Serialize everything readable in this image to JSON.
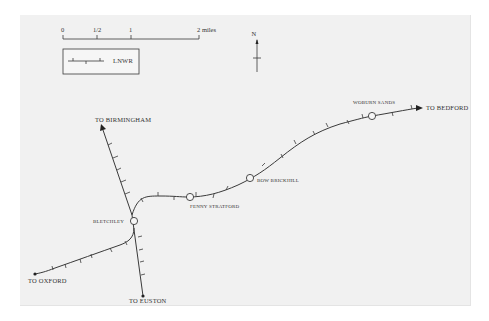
{
  "map": {
    "title": "Railway map around Bletchley",
    "scale_bar": {
      "ticks": [
        "0",
        "1/2",
        "1",
        "2 miles"
      ],
      "unit": "miles"
    },
    "legend": {
      "items": [
        {
          "symbol": "railway-line-with-ticks",
          "label": "LNWR"
        }
      ]
    },
    "north_arrow": {
      "label": "N"
    },
    "stations": [
      {
        "name": "BLETCHLEY"
      },
      {
        "name": "FENNY STRATFORD"
      },
      {
        "name": "BOW BRICKHILL"
      },
      {
        "name": "WOBURN SANDS"
      }
    ],
    "destinations": [
      {
        "name": "TO BIRMINGHAM"
      },
      {
        "name": "TO BEDFORD"
      },
      {
        "name": "TO OXFORD"
      },
      {
        "name": "TO EUSTON"
      }
    ],
    "colors": {
      "background": "#f1f1f1",
      "line": "#3a3a3a",
      "text": "#333333"
    }
  }
}
